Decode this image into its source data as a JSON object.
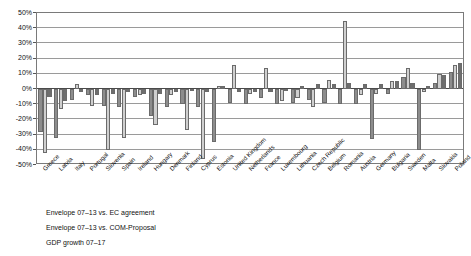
{
  "chart_data": {
    "type": "bar",
    "title": "",
    "subtitle": "",
    "xlabel": "",
    "ylabel": "",
    "ylim": [
      -50,
      50
    ],
    "ytick_labels": [
      "50%",
      "40%",
      "30%",
      "20%",
      "10%",
      "0%",
      "-10%",
      "-20%",
      "-30%",
      "-40%",
      "-50%"
    ],
    "ytick_values": [
      50,
      40,
      30,
      20,
      10,
      0,
      -10,
      -20,
      -30,
      -40,
      -50
    ],
    "grid": true,
    "legend_position": "below-plot",
    "categories": [
      "Greece",
      "Latvia",
      "Italy",
      "Portugal",
      "Slovenia",
      "Spain",
      "Ireland",
      "Hungary",
      "Denmark",
      "Finland",
      "Cyprus",
      "Estonia",
      "United Kingdom",
      "Netherlands",
      "France",
      "Luxembourg",
      "Lithuania",
      "Czech Republic",
      "Belgium",
      "Romania",
      "Austria",
      "Germany",
      "Bulgaria",
      "Sweden",
      "Malta",
      "Slovakia",
      "Poland"
    ],
    "series": [
      {
        "name": "Envelope 07-13 vs. EC agreement",
        "values": [
          -28,
          -32,
          -7,
          -4,
          -11,
          -12,
          -5,
          -18,
          -12,
          -10,
          -12,
          -35,
          -9,
          -10,
          -6,
          -10,
          -9,
          -7,
          -9,
          -10,
          -10,
          -33,
          -3,
          8,
          -40,
          4,
          11
        ]
      },
      {
        "name": "Envelope 07-13 vs. COM-Proposal",
        "values": [
          -42,
          -13,
          3,
          -11,
          -40,
          -32,
          -4,
          -24,
          -4,
          -27,
          -46,
          2,
          16,
          -3,
          14,
          -8,
          -6,
          -12,
          6,
          45,
          -4,
          -3,
          5,
          14,
          -2,
          10,
          16
        ]
      },
      {
        "name": "GDP growth 07-17",
        "values": [
          -5,
          -8,
          -2,
          -4,
          -3,
          -2,
          -3,
          -3,
          -2,
          -1,
          -2,
          2,
          -2,
          -2,
          -2,
          -1,
          2,
          3,
          3,
          4,
          3,
          3,
          5,
          4,
          2,
          9,
          17
        ]
      }
    ]
  },
  "legend": {
    "items": [
      {
        "label": "Envelope 07–13 vs. EC agreement",
        "color": "#8d8d8d"
      },
      {
        "label": "Envelope 07–13 vs. COM-Proposal",
        "color": "#cfcfcf"
      },
      {
        "label": "GDP growth 07–17",
        "color": "#6e6e6e"
      }
    ]
  }
}
